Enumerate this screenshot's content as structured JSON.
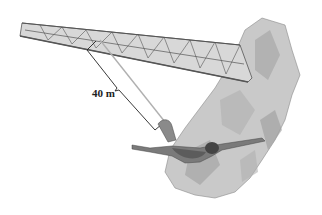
{
  "figure": {
    "labels": {
      "cord_length": "40 m"
    },
    "elements": [
      "truss-bridge",
      "rocky-cliff",
      "bungee-cord",
      "dimension-bracket",
      "jumper"
    ],
    "colors": {
      "background": "#ffffff",
      "ink": "#222222",
      "bridge": "#555555",
      "rock": "#9a9a9a",
      "cord": "#b0b0b0"
    }
  }
}
